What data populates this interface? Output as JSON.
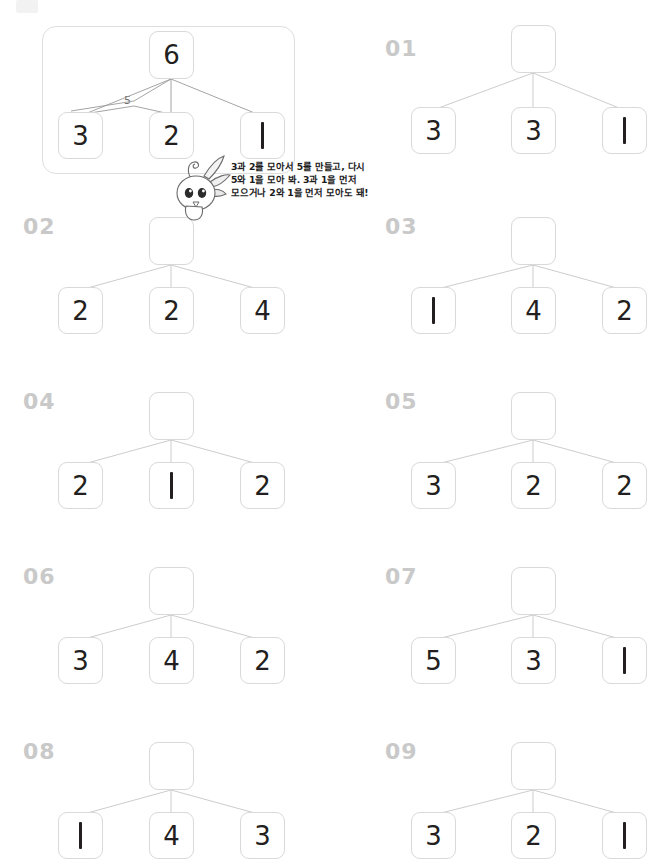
{
  "page": {
    "corner_mark": "",
    "colors": {
      "box_border": "#d9d9d9",
      "container_border": "#dedede",
      "digit": "#231f20",
      "problem_number": "#c9c9c9",
      "line": "#9a9a9a",
      "sub_label": "#6f6f6f"
    }
  },
  "example": {
    "name": "example",
    "top": "6",
    "children": [
      "3",
      "2",
      "1"
    ],
    "sub_label": "5",
    "speech_lines": [
      "3과 2를 모아서 5를 만들고, 다시",
      "5와 1을 모아 봐. 3과 1을 먼저",
      "모으거나 2와 1을 먼저 모아도 돼!"
    ],
    "mascot_name": "rabbit-mascot"
  },
  "problems": [
    {
      "number": "01",
      "top": "",
      "children": [
        "3",
        "3",
        "1"
      ]
    },
    {
      "number": "02",
      "top": "",
      "children": [
        "2",
        "2",
        "4"
      ]
    },
    {
      "number": "03",
      "top": "",
      "children": [
        "1",
        "4",
        "2"
      ]
    },
    {
      "number": "04",
      "top": "",
      "children": [
        "2",
        "1",
        "2"
      ]
    },
    {
      "number": "05",
      "top": "",
      "children": [
        "3",
        "2",
        "2"
      ]
    },
    {
      "number": "06",
      "top": "",
      "children": [
        "3",
        "4",
        "2"
      ]
    },
    {
      "number": "07",
      "top": "",
      "children": [
        "5",
        "3",
        "1"
      ]
    },
    {
      "number": "08",
      "top": "",
      "children": [
        "1",
        "4",
        "3"
      ]
    },
    {
      "number": "09",
      "top": "",
      "children": [
        "3",
        "2",
        "1"
      ]
    }
  ]
}
